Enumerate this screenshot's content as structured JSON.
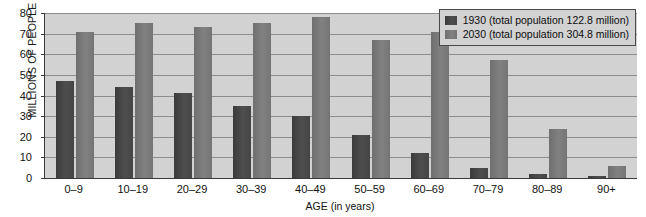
{
  "chart_data": {
    "type": "bar",
    "title": "",
    "subtitle": "",
    "xlabel": "AGE (in years)",
    "ylabel": "MILLIONS OF PEOPLE",
    "categories": [
      "0–9",
      "10–19",
      "20–29",
      "30–39",
      "40–49",
      "50–59",
      "60–69",
      "70–79",
      "80–89",
      "90+"
    ],
    "series": [
      {
        "name": "1930 (total population 122.8 million)",
        "short_name": "1930",
        "color": "#454545",
        "values": [
          47,
          44,
          41,
          35,
          30,
          21,
          12,
          5,
          2,
          1
        ]
      },
      {
        "name": "2030 (total population 304.8 million)",
        "short_name": "2030",
        "color": "#7a7a7a",
        "values": [
          71,
          75,
          73,
          75,
          78,
          67,
          71,
          57,
          24,
          6
        ]
      }
    ],
    "ylim": [
      0,
      80
    ],
    "ytick_values": [
      80,
      70,
      60,
      50,
      40,
      30,
      20,
      10,
      0
    ],
    "ytick_labels": [
      "80",
      "70",
      "60",
      "50",
      "40",
      "30",
      "20",
      "10",
      "0"
    ],
    "grid": true,
    "grid_axis": "y",
    "legend_position": "top-right",
    "plot_background": "#d2d2d2",
    "gridline_color": "#8d8d8d",
    "axis_color": "#3a3a3a"
  },
  "legend": {
    "items": [
      {
        "label": "1930 (total population 122.8 million)",
        "swatch": "bar-swatch-1930"
      },
      {
        "label": "2030 (total population 304.8 million)",
        "swatch": "bar-swatch-2030"
      }
    ]
  }
}
